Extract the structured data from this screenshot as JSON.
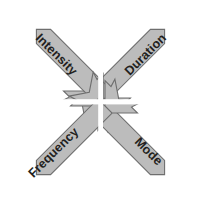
{
  "diagram": {
    "type": "converging-arrows",
    "background_color": "#ffffff",
    "arrow_fill_color": "#bcbcbc",
    "arrow_stroke_color": "#6e6e6e",
    "label_color": "#231f20",
    "center_gap_color": "#ffffff",
    "arrow_count": 4,
    "arrows": [
      {
        "id": "intensity",
        "label": "Intensity",
        "origin": "top-left",
        "direction": "down-right",
        "rotation_deg": 45
      },
      {
        "id": "duration",
        "label": "Duration",
        "origin": "top-right",
        "direction": "down-left",
        "rotation_deg": 45
      },
      {
        "id": "frequency",
        "label": "Frequency",
        "origin": "bottom-left",
        "direction": "up-right",
        "rotation_deg": -45
      },
      {
        "id": "mode",
        "label": "Mode",
        "origin": "bottom-right",
        "direction": "up-left",
        "rotation_deg": -45
      }
    ]
  }
}
